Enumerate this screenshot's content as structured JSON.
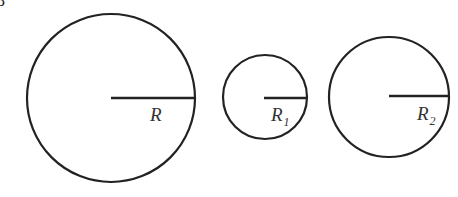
{
  "figure": {
    "corner_fragment": "8",
    "circles": [
      {
        "name": "large",
        "label": "R",
        "subscript": ""
      },
      {
        "name": "small",
        "label": "R",
        "subscript": "1"
      },
      {
        "name": "medium",
        "label": "R",
        "subscript": "2"
      }
    ]
  }
}
